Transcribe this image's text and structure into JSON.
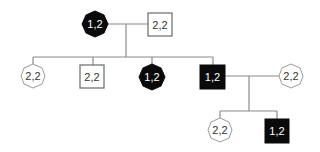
{
  "diagram": {
    "type": "pedigree",
    "generations": [
      {
        "index": 1,
        "individuals": [
          {
            "id": "I-1",
            "sex": "female",
            "affected": true,
            "genotype": "1,2"
          },
          {
            "id": "I-2",
            "sex": "male",
            "affected": false,
            "genotype": "2,2"
          }
        ]
      },
      {
        "index": 2,
        "individuals": [
          {
            "id": "II-1",
            "sex": "female",
            "affected": false,
            "genotype": "2,2"
          },
          {
            "id": "II-2",
            "sex": "male",
            "affected": false,
            "genotype": "2,2"
          },
          {
            "id": "II-3",
            "sex": "female",
            "affected": true,
            "genotype": "1,2"
          },
          {
            "id": "II-4",
            "sex": "male",
            "affected": true,
            "genotype": "1,2"
          },
          {
            "id": "II-5",
            "sex": "female",
            "affected": false,
            "genotype": "2,2"
          }
        ]
      },
      {
        "index": 3,
        "individuals": [
          {
            "id": "III-1",
            "sex": "female",
            "affected": false,
            "genotype": "2,2"
          },
          {
            "id": "III-2",
            "sex": "male",
            "affected": true,
            "genotype": "1,2"
          }
        ]
      }
    ],
    "colors": {
      "affected": "#0a0a0a",
      "unaffected": "#ffffff",
      "line": "#8a8a8a"
    }
  }
}
